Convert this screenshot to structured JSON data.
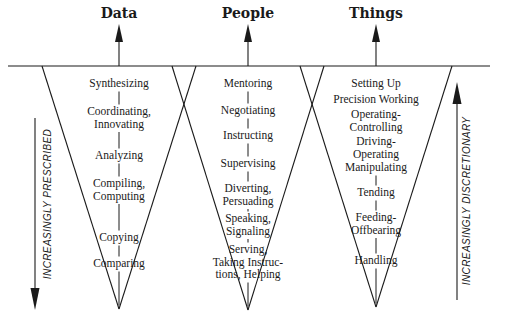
{
  "diagram": {
    "baseline": {
      "y": 66,
      "x1": 8,
      "x2": 490
    },
    "columns": [
      {
        "title": "Data",
        "center_x": 119,
        "cone": {
          "left_top_x": 42,
          "right_top_x": 196,
          "tip_y": 309
        },
        "items": [
          {
            "lines": [
              "Synthesizing"
            ],
            "y": 78
          },
          {
            "lines": [
              "Coordinating,",
              "Innovating"
            ],
            "y": 106
          },
          {
            "lines": [
              "Analyzing"
            ],
            "y": 150
          },
          {
            "lines": [
              "Compiling,",
              "Computing"
            ],
            "y": 178
          },
          {
            "lines": [
              "Copying"
            ],
            "y": 232
          },
          {
            "lines": [
              "Comparing"
            ],
            "y": 258
          }
        ]
      },
      {
        "title": "People",
        "center_x": 248,
        "cone": {
          "left_top_x": 172,
          "right_top_x": 324,
          "tip_y": 310
        },
        "items": [
          {
            "lines": [
              "Mentoring"
            ],
            "y": 78
          },
          {
            "lines": [
              "Negotiating"
            ],
            "y": 105
          },
          {
            "lines": [
              "Instructing"
            ],
            "y": 130
          },
          {
            "lines": [
              "Supervising"
            ],
            "y": 158
          },
          {
            "lines": [
              "Diverting,",
              "Persuading"
            ],
            "y": 183
          },
          {
            "lines": [
              "Speaking,",
              "Signaling"
            ],
            "y": 213
          },
          {
            "lines": [
              "Serving,",
              "Taking Instruc-",
              "tions, Helping"
            ],
            "y": 244
          }
        ]
      },
      {
        "title": "Things",
        "center_x": 376,
        "cone": {
          "left_top_x": 300,
          "right_top_x": 452,
          "tip_y": 307
        },
        "items": [
          {
            "lines": [
              "Setting Up"
            ],
            "y": 78
          },
          {
            "lines": [
              "Precision Working"
            ],
            "y": 94
          },
          {
            "lines": [
              "Operating-",
              "Controlling"
            ],
            "y": 109
          },
          {
            "lines": [
              "Driving-",
              "Operating"
            ],
            "y": 136
          },
          {
            "lines": [
              "Manipulating"
            ],
            "y": 162
          },
          {
            "lines": [
              "Tending"
            ],
            "y": 187
          },
          {
            "lines": [
              "Feeding-",
              "Offbearing"
            ],
            "y": 212
          },
          {
            "lines": [
              "Handling"
            ],
            "y": 255
          }
        ]
      }
    ],
    "left_axis": {
      "label": "INCREASINGLY PRESCRIBED",
      "x": 35,
      "y_top": 118,
      "y_bottom": 310,
      "direction": "down"
    },
    "right_axis": {
      "label": "INCREASINGLY DISCRETIONARY",
      "x": 457,
      "y_top": 82,
      "y_bottom": 300,
      "direction": "up"
    },
    "colors": {
      "ink": "#1a1a1a",
      "background": "#ffffff"
    }
  }
}
